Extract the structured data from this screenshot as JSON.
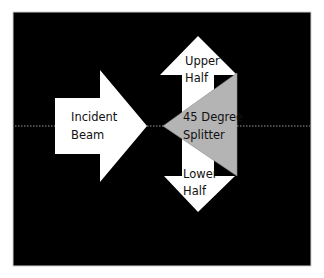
{
  "diagram": {
    "background_color": "#000000",
    "page_color": "#ffffff",
    "arrow_color": "#ffffff",
    "splitter_color": "#b4b4b4",
    "axis_line_color": "#9a9a9a",
    "incident": {
      "line1": "Incident",
      "line2": "Beam"
    },
    "upper": {
      "line1": "Upper",
      "line2": "Half"
    },
    "lower": {
      "line1": "Lower",
      "line2": "Half"
    },
    "splitter": {
      "line1": "45 Degree",
      "line2": "Splitter"
    }
  }
}
